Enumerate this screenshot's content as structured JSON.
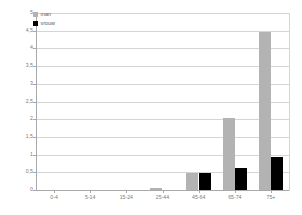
{
  "chart_data": {
    "type": "bar",
    "title": "",
    "subtitle": "",
    "xlabel": "",
    "ylabel": "",
    "categories": [
      "0-4",
      "5-14",
      "15-24",
      "25-44",
      "45-64",
      "65-74",
      "75+"
    ],
    "series": [
      {
        "name": "man",
        "color": "#b3b3b3",
        "values": [
          0,
          0,
          0,
          0.07,
          0.48,
          2.03,
          4.45
        ]
      },
      {
        "name": "vrouw",
        "color": "#000000",
        "values": [
          0,
          0,
          0,
          0,
          0.47,
          0.62,
          0.93
        ]
      }
    ],
    "ylim": [
      0,
      5
    ],
    "ytick_step": 0.5,
    "ytick_labels": [
      "5",
      "4,5",
      "4",
      "3,5",
      "3",
      "2,5",
      "2",
      "1,5",
      "1",
      "0,5",
      "0"
    ],
    "ytick_values": [
      5,
      4.5,
      4,
      3.5,
      3,
      2.5,
      2,
      1.5,
      1,
      0.5,
      0
    ],
    "grid": true,
    "legend_position": "top-left",
    "background_color": "#ffffff",
    "axis_color": "#a8a8a8",
    "grid_color": "#d5d5d5"
  },
  "legend": {
    "items": [
      {
        "label": "man"
      },
      {
        "label": "vrouw"
      }
    ]
  }
}
